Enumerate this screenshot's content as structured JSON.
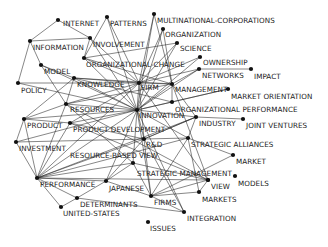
{
  "diagram": {
    "type": "keyword-co-occurrence-network",
    "nodes": [
      {
        "id": "internet",
        "label": "INTERNET",
        "x": 58,
        "y": 20,
        "lx": 63,
        "ly": 20
      },
      {
        "id": "patterns",
        "label": "PATTERNS",
        "x": 107,
        "y": 17,
        "lx": 110,
        "ly": 20
      },
      {
        "id": "multinational-corporations",
        "label": "MULTINATIONAL-CORPORATIONS",
        "x": 154,
        "y": 14,
        "lx": 157,
        "ly": 17
      },
      {
        "id": "organization",
        "label": "ORGANIZATION",
        "x": 163,
        "y": 29,
        "lx": 165,
        "ly": 31
      },
      {
        "id": "science",
        "label": "SCIENCE",
        "x": 177,
        "y": 43,
        "lx": 180,
        "ly": 45
      },
      {
        "id": "information",
        "label": "INFORMATION",
        "x": 30,
        "y": 41,
        "lx": 33,
        "ly": 44
      },
      {
        "id": "involvement",
        "label": "INVOLVEMENT",
        "x": 90,
        "y": 38,
        "lx": 93,
        "ly": 41
      },
      {
        "id": "organizational-change",
        "label": "ORGANIZATIONAL-CHANGE",
        "x": 84,
        "y": 58,
        "lx": 86,
        "ly": 61
      },
      {
        "id": "ownership",
        "label": "OWNERSHIP",
        "x": 200,
        "y": 57,
        "lx": 203,
        "ly": 59
      },
      {
        "id": "model",
        "label": "MODEL",
        "x": 41,
        "y": 65,
        "lx": 44,
        "ly": 68
      },
      {
        "id": "networks",
        "label": "NETWORKS",
        "x": 199,
        "y": 69,
        "lx": 202,
        "ly": 72
      },
      {
        "id": "impact",
        "label": "IMPACT",
        "x": 251,
        "y": 69,
        "lx": 254,
        "ly": 73
      },
      {
        "id": "policy",
        "label": "POLICY",
        "x": 18,
        "y": 83,
        "lx": 21,
        "ly": 87
      },
      {
        "id": "knowledge",
        "label": "KNOWLEDGE",
        "x": 74,
        "y": 78,
        "lx": 77,
        "ly": 81
      },
      {
        "id": "firm",
        "label": "FIRM",
        "x": 139,
        "y": 83,
        "lx": 141,
        "ly": 84
      },
      {
        "id": "management",
        "label": "MANAGEMENT",
        "x": 172,
        "y": 84,
        "lx": 175,
        "ly": 86
      },
      {
        "id": "market-orientation",
        "label": "MARKET ORIENTATION",
        "x": 228,
        "y": 89,
        "lx": 231,
        "ly": 93
      },
      {
        "id": "organizational-performance",
        "label": "ORGANIZATIONAL PERFORMANCE",
        "x": 172,
        "y": 102,
        "lx": 175,
        "ly": 106
      },
      {
        "id": "resources",
        "label": "RESOURCES",
        "x": 66,
        "y": 104,
        "lx": 70,
        "ly": 106
      },
      {
        "id": "innovation",
        "label": "INNOVATION",
        "x": 137,
        "y": 110,
        "lx": 139,
        "ly": 112
      },
      {
        "id": "industry",
        "label": "INDUSTRY",
        "x": 196,
        "y": 117,
        "lx": 199,
        "ly": 120
      },
      {
        "id": "joint-ventures",
        "label": "JOINT VENTURES",
        "x": 243,
        "y": 119,
        "lx": 246,
        "ly": 122
      },
      {
        "id": "product",
        "label": "PRODUCT",
        "x": 24,
        "y": 119,
        "lx": 27,
        "ly": 122
      },
      {
        "id": "product-development",
        "label": "PRODUCT DEVELOPMENT",
        "x": 70,
        "y": 123,
        "lx": 73,
        "ly": 126
      },
      {
        "id": "investment",
        "label": "INVESTMENT",
        "x": 16,
        "y": 142,
        "lx": 19,
        "ly": 145
      },
      {
        "id": "r-and-d",
        "label": "R&D",
        "x": 144,
        "y": 139,
        "lx": 146,
        "ly": 141
      },
      {
        "id": "strategic-alliances",
        "label": "STRATEGIC ALLIANCES",
        "x": 188,
        "y": 138,
        "lx": 191,
        "ly": 141
      },
      {
        "id": "resource-based-view",
        "label": "RESOURCE-BASED VIEW",
        "x": 133,
        "y": 163,
        "lx": 70,
        "ly": 152
      },
      {
        "id": "market",
        "label": "MARKET",
        "x": 233,
        "y": 155,
        "lx": 236,
        "ly": 158
      },
      {
        "id": "strategic-management",
        "label": "STRATEGIC MANAGEMENT",
        "x": 208,
        "y": 180,
        "lx": 137,
        "ly": 170
      },
      {
        "id": "view",
        "label": "VIEW",
        "x": 208,
        "y": 180,
        "lx": 211,
        "ly": 183
      },
      {
        "id": "models",
        "label": "MODELS",
        "x": 235,
        "y": 176,
        "lx": 238,
        "ly": 180
      },
      {
        "id": "performance",
        "label": "PERFORMANCE",
        "x": 37,
        "y": 178,
        "lx": 40,
        "ly": 181
      },
      {
        "id": "japanese",
        "label": "JAPANESE",
        "x": 106,
        "y": 181,
        "lx": 109,
        "ly": 185
      },
      {
        "id": "markets",
        "label": "MARKETS",
        "x": 199,
        "y": 192,
        "lx": 202,
        "ly": 196
      },
      {
        "id": "determinants",
        "label": "DETERMINANTS",
        "x": 77,
        "y": 198,
        "lx": 80,
        "ly": 201
      },
      {
        "id": "firms",
        "label": "FIRMS",
        "x": 151,
        "y": 196,
        "lx": 154,
        "ly": 199
      },
      {
        "id": "united-states",
        "label": "UNITED-STATES",
        "x": 61,
        "y": 207,
        "lx": 63,
        "ly": 210
      },
      {
        "id": "integration",
        "label": "INTEGRATION",
        "x": 184,
        "y": 212,
        "lx": 187,
        "ly": 215
      },
      {
        "id": "issues",
        "label": "ISSUES",
        "x": 148,
        "y": 222,
        "lx": 150,
        "ly": 225
      }
    ],
    "edges": [
      [
        "internet",
        "information"
      ],
      [
        "internet",
        "involvement"
      ],
      [
        "information",
        "model"
      ],
      [
        "information",
        "policy"
      ],
      [
        "information",
        "involvement"
      ],
      [
        "patterns",
        "organizational-change"
      ],
      [
        "patterns",
        "innovation"
      ],
      [
        "patterns",
        "firm"
      ],
      [
        "involvement",
        "organizational-change"
      ],
      [
        "involvement",
        "firm"
      ],
      [
        "involvement",
        "innovation"
      ],
      [
        "multinational-corporations",
        "firm"
      ],
      [
        "multinational-corporations",
        "innovation"
      ],
      [
        "multinational-corporations",
        "management"
      ],
      [
        "organization",
        "firm"
      ],
      [
        "organization",
        "innovation"
      ],
      [
        "organization",
        "management"
      ],
      [
        "science",
        "organizational-change"
      ],
      [
        "science",
        "innovation"
      ],
      [
        "science",
        "firm"
      ],
      [
        "organizational-change",
        "innovation"
      ],
      [
        "organizational-change",
        "firm"
      ],
      [
        "organizational-change",
        "management"
      ],
      [
        "ownership",
        "firm"
      ],
      [
        "ownership",
        "innovation"
      ],
      [
        "networks",
        "impact"
      ],
      [
        "networks",
        "innovation"
      ],
      [
        "networks",
        "firm"
      ],
      [
        "networks",
        "management"
      ],
      [
        "model",
        "knowledge"
      ],
      [
        "model",
        "innovation"
      ],
      [
        "model",
        "resources"
      ],
      [
        "knowledge",
        "firm"
      ],
      [
        "knowledge",
        "innovation"
      ],
      [
        "knowledge",
        "management"
      ],
      [
        "knowledge",
        "resources"
      ],
      [
        "knowledge",
        "product"
      ],
      [
        "policy",
        "innovation"
      ],
      [
        "policy",
        "firm"
      ],
      [
        "firm",
        "innovation"
      ],
      [
        "firm",
        "management"
      ],
      [
        "firm",
        "resources"
      ],
      [
        "firm",
        "performance"
      ],
      [
        "firm",
        "strategic-management"
      ],
      [
        "firm",
        "r-and-d"
      ],
      [
        "management",
        "innovation"
      ],
      [
        "management",
        "organizational-performance"
      ],
      [
        "management",
        "strategic-management"
      ],
      [
        "management",
        "resources"
      ],
      [
        "management",
        "industry"
      ],
      [
        "market-orientation",
        "organizational-performance"
      ],
      [
        "market-orientation",
        "innovation"
      ],
      [
        "organizational-performance",
        "innovation"
      ],
      [
        "organizational-performance",
        "knowledge"
      ],
      [
        "resources",
        "innovation"
      ],
      [
        "resources",
        "performance"
      ],
      [
        "resources",
        "product"
      ],
      [
        "resources",
        "strategic-management"
      ],
      [
        "resources",
        "resource-based-view"
      ],
      [
        "innovation",
        "industry"
      ],
      [
        "innovation",
        "product"
      ],
      [
        "innovation",
        "product-development"
      ],
      [
        "innovation",
        "r-and-d"
      ],
      [
        "innovation",
        "strategic-alliances"
      ],
      [
        "innovation",
        "performance"
      ],
      [
        "innovation",
        "investment"
      ],
      [
        "innovation",
        "japanese"
      ],
      [
        "innovation",
        "firms"
      ],
      [
        "innovation",
        "resource-based-view"
      ],
      [
        "industry",
        "joint-ventures"
      ],
      [
        "industry",
        "strategic-alliances"
      ],
      [
        "industry",
        "performance"
      ],
      [
        "industry",
        "r-and-d"
      ],
      [
        "product",
        "product-development"
      ],
      [
        "product",
        "performance"
      ],
      [
        "product",
        "investment"
      ],
      [
        "product-development",
        "r-and-d"
      ],
      [
        "product-development",
        "performance"
      ],
      [
        "product-development",
        "firm"
      ],
      [
        "product-development",
        "strategic-management"
      ],
      [
        "investment",
        "performance"
      ],
      [
        "investment",
        "r-and-d"
      ],
      [
        "r-and-d",
        "firms"
      ],
      [
        "r-and-d",
        "performance"
      ],
      [
        "r-and-d",
        "strategic-alliances"
      ],
      [
        "r-and-d",
        "japanese"
      ],
      [
        "r-and-d",
        "industry"
      ],
      [
        "strategic-alliances",
        "market"
      ],
      [
        "strategic-alliances",
        "firms"
      ],
      [
        "strategic-alliances",
        "performance"
      ],
      [
        "strategic-alliances",
        "markets"
      ],
      [
        "resource-based-view",
        "performance"
      ],
      [
        "resource-based-view",
        "firms"
      ],
      [
        "resource-based-view",
        "japanese"
      ],
      [
        "resource-based-view",
        "strategic-management"
      ],
      [
        "market",
        "firms"
      ],
      [
        "strategic-management",
        "performance"
      ],
      [
        "strategic-management",
        "firms"
      ],
      [
        "strategic-management",
        "markets"
      ],
      [
        "performance",
        "united-states"
      ],
      [
        "performance",
        "japanese"
      ],
      [
        "japanese",
        "determinants"
      ],
      [
        "japanese",
        "firms"
      ],
      [
        "determinants",
        "united-states"
      ],
      [
        "determinants",
        "integration"
      ],
      [
        "firms",
        "integration"
      ],
      [
        "firms",
        "markets"
      ],
      [
        "integration",
        "r-and-d"
      ],
      [
        "integration",
        "innovation"
      ],
      [
        "performance",
        "determinants"
      ]
    ]
  }
}
